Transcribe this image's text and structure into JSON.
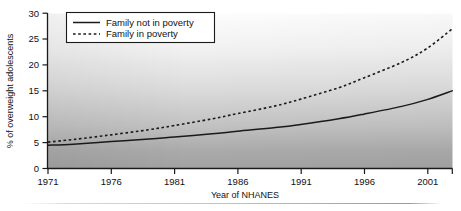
{
  "chart_data": {
    "type": "line",
    "title": "",
    "subtitle": "",
    "xlabel": "Year of NHANES",
    "ylabel": "% of overweight adolescents",
    "xlim": [
      1971,
      2003
    ],
    "ylim": [
      0,
      30
    ],
    "xticks": [
      1971,
      1976,
      1981,
      1986,
      1991,
      1996,
      2001
    ],
    "xticklabels": [
      "1971",
      "1976",
      "1981",
      "1986",
      "1991",
      "1996",
      "2001"
    ],
    "yticks": [
      0,
      5,
      10,
      15,
      20,
      25,
      30
    ],
    "yticklabels": [
      "0",
      "5",
      "10",
      "15",
      "20",
      "25",
      "30"
    ],
    "grid": false,
    "legend_position": "upper left",
    "x": [
      1971,
      1973,
      1976,
      1979,
      1981,
      1984,
      1986,
      1989,
      1991,
      1994,
      1996,
      1999,
      2001,
      2003
    ],
    "series": [
      {
        "name": "Family not in poverty",
        "style": "solid",
        "color": "#1a1a1a",
        "values": [
          4.5,
          4.7,
          5.2,
          5.7,
          6.1,
          6.7,
          7.2,
          7.9,
          8.5,
          9.6,
          10.5,
          12.0,
          13.3,
          15.0
        ]
      },
      {
        "name": "Family in poverty",
        "style": "dashed",
        "color": "#1a1a1a",
        "values": [
          5.1,
          5.6,
          6.5,
          7.5,
          8.3,
          9.6,
          10.6,
          12.1,
          13.4,
          15.6,
          17.5,
          20.5,
          23.2,
          27.0
        ]
      }
    ],
    "legend": [
      {
        "label": "Family not in poverty",
        "style": "solid"
      },
      {
        "label": "Family in poverty",
        "style": "dashed"
      }
    ],
    "background": {
      "plot_gradient_top": "#fdfdfd",
      "plot_gradient_bottom": "#a6a6a6",
      "axis_color": "#1a1a1a"
    }
  }
}
